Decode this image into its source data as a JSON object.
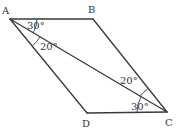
{
  "figure": {
    "type": "parallelogram-with-diagonal",
    "colors": {
      "line": "#3a3a3a",
      "text": "#333333",
      "background": "#ffffff"
    },
    "vertices": {
      "A": {
        "label": "A",
        "x": 10,
        "y": 19
      },
      "B": {
        "label": "B",
        "x": 93,
        "y": 19
      },
      "C": {
        "label": "C",
        "x": 167,
        "y": 112
      },
      "D": {
        "label": "D",
        "x": 87,
        "y": 113
      }
    },
    "segments": [
      "AB",
      "BC",
      "CD",
      "DA",
      "AC"
    ],
    "angles": [
      {
        "vertex": "A",
        "between": [
          "AB",
          "AC"
        ],
        "label": "30°"
      },
      {
        "vertex": "A",
        "between": [
          "AC",
          "AD"
        ],
        "label": "20°"
      },
      {
        "vertex": "C",
        "between": [
          "CB",
          "CA"
        ],
        "label": "20°"
      },
      {
        "vertex": "C",
        "between": [
          "CA",
          "CD"
        ],
        "label": "30°"
      }
    ]
  }
}
